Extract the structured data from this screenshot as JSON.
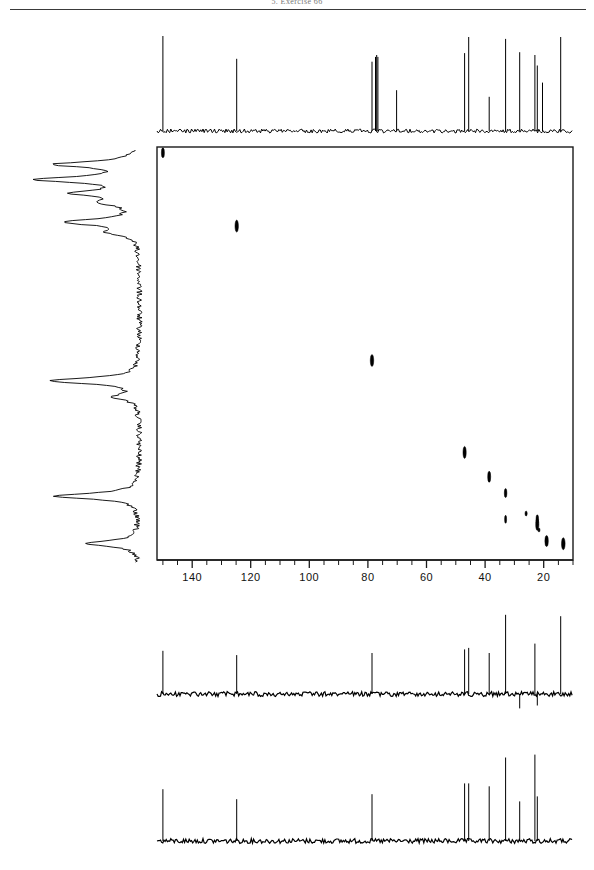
{
  "page": {
    "header_title": "5. Exercise 66",
    "width": 594,
    "height": 870,
    "background_color": "#ffffff",
    "ink_color": "#000000"
  },
  "chart_data": {
    "type": "scatter",
    "xlabel": "",
    "ylabel": "",
    "axis": {
      "orientation": "horizontal",
      "units": "ppm",
      "direction": "reversed",
      "xlim": [
        152,
        10
      ],
      "tick_labels": [
        "140",
        "120",
        "100",
        "80",
        "60",
        "40",
        "20"
      ],
      "tick_values": [
        140,
        120,
        100,
        80,
        60,
        40,
        20
      ],
      "minor_tick_step": 5,
      "grid": false,
      "legend": null
    },
    "box": {
      "left_px": 157,
      "right_px": 573,
      "top_px": 147,
      "bottom_px": 560,
      "border": true
    },
    "cross_peaks": [
      {
        "x": 150.0,
        "y": 150.0,
        "w": 3.0,
        "h": 10,
        "label": "diagonal-1"
      },
      {
        "x": 124.8,
        "y": 124.8,
        "w": 3.4,
        "h": 12,
        "label": "diagonal-2"
      },
      {
        "x": 78.6,
        "y": 78.6,
        "w": 3.4,
        "h": 12,
        "label": "diagonal-3"
      },
      {
        "x": 47.0,
        "y": 47.0,
        "w": 3.2,
        "h": 12,
        "label": "diagonal-4"
      },
      {
        "x": 38.6,
        "y": 38.6,
        "w": 3.0,
        "h": 11,
        "label": "diagonal-5"
      },
      {
        "x": 33.0,
        "y": 33.0,
        "w": 2.6,
        "h": 9,
        "label": "diagonal-6"
      },
      {
        "x": 26.0,
        "y": 26.0,
        "w": 2.2,
        "h": 5,
        "label": "diagonal-7"
      },
      {
        "x": 22.2,
        "y": 22.2,
        "w": 3.2,
        "h": 12,
        "label": "diagonal-8"
      },
      {
        "x": 21.6,
        "y": 20.3,
        "w": 2.0,
        "h": 4,
        "label": "cross-a"
      },
      {
        "x": 19.0,
        "y": 16.5,
        "w": 3.4,
        "h": 11,
        "label": "cross-b"
      },
      {
        "x": 13.3,
        "y": 15.6,
        "w": 3.6,
        "h": 12,
        "label": "cross-c"
      },
      {
        "x": 33.0,
        "y": 24.0,
        "w": 2.0,
        "h": 8,
        "label": "cross-d"
      },
      {
        "x": 22.2,
        "y": 24.0,
        "w": 2.6,
        "h": 9,
        "label": "cross-e"
      }
    ],
    "top_trace": {
      "name": "carbon-13 broadband decoupled spectrum",
      "baseline_y_px": 131,
      "peaks": [
        {
          "ppm": 150.0,
          "height": 100
        },
        {
          "ppm": 124.8,
          "height": 76
        },
        {
          "ppm": 78.6,
          "height": 73
        },
        {
          "ppm": 77.4,
          "height": 78
        },
        {
          "ppm": 77.0,
          "height": 80
        },
        {
          "ppm": 76.6,
          "height": 78
        },
        {
          "ppm": 70.2,
          "height": 43
        },
        {
          "ppm": 47.0,
          "height": 82
        },
        {
          "ppm": 45.6,
          "height": 99
        },
        {
          "ppm": 38.6,
          "height": 36
        },
        {
          "ppm": 33.0,
          "height": 97
        },
        {
          "ppm": 28.2,
          "height": 83
        },
        {
          "ppm": 23.0,
          "height": 80
        },
        {
          "ppm": 22.2,
          "height": 69
        },
        {
          "ppm": 20.4,
          "height": 51
        },
        {
          "ppm": 14.2,
          "height": 99
        }
      ]
    },
    "left_trace": {
      "name": "proton projection trace",
      "peaks": [
        {
          "pos": 0.035,
          "height": 0.78
        },
        {
          "pos": 0.072,
          "height": 0.92
        },
        {
          "pos": 0.105,
          "height": 0.55
        },
        {
          "pos": 0.128,
          "height": 0.3
        },
        {
          "pos": 0.175,
          "height": 0.7
        },
        {
          "pos": 0.2,
          "height": 0.25
        },
        {
          "pos": 0.56,
          "height": 0.85
        },
        {
          "pos": 0.6,
          "height": 0.22
        },
        {
          "pos": 0.84,
          "height": 0.8
        },
        {
          "pos": 0.955,
          "height": 0.52
        }
      ]
    },
    "dept_135_trace": {
      "name": "DEPT-135 spectrum",
      "baseline_y_px": 694,
      "peaks": [
        {
          "ppm": 150.0,
          "height": 60,
          "phase": "positive"
        },
        {
          "ppm": 124.8,
          "height": 54,
          "phase": "positive"
        },
        {
          "ppm": 78.6,
          "height": 57,
          "phase": "positive"
        },
        {
          "ppm": 47.0,
          "height": 62,
          "phase": "positive"
        },
        {
          "ppm": 45.6,
          "height": 64,
          "phase": "positive"
        },
        {
          "ppm": 38.6,
          "height": 57,
          "phase": "positive"
        },
        {
          "ppm": 33.0,
          "height": 110,
          "phase": "positive"
        },
        {
          "ppm": 28.2,
          "height": 20,
          "phase": "negative"
        },
        {
          "ppm": 23.0,
          "height": 70,
          "phase": "positive"
        },
        {
          "ppm": 22.2,
          "height": 16,
          "phase": "negative"
        },
        {
          "ppm": 14.2,
          "height": 108,
          "phase": "positive"
        }
      ]
    },
    "dept_90_trace": {
      "name": "DEPT-90 spectrum",
      "baseline_y_px": 841,
      "peaks": [
        {
          "ppm": 150.0,
          "height": 72,
          "phase": "positive"
        },
        {
          "ppm": 124.8,
          "height": 58,
          "phase": "positive"
        },
        {
          "ppm": 78.6,
          "height": 65,
          "phase": "positive"
        },
        {
          "ppm": 47.0,
          "height": 80,
          "phase": "positive"
        },
        {
          "ppm": 45.6,
          "height": 80,
          "phase": "positive"
        },
        {
          "ppm": 38.6,
          "height": 76,
          "phase": "positive"
        },
        {
          "ppm": 33.0,
          "height": 116,
          "phase": "positive"
        },
        {
          "ppm": 28.2,
          "height": 55,
          "phase": "positive"
        },
        {
          "ppm": 23.0,
          "height": 120,
          "phase": "positive"
        },
        {
          "ppm": 22.2,
          "height": 62,
          "phase": "positive"
        }
      ]
    }
  }
}
